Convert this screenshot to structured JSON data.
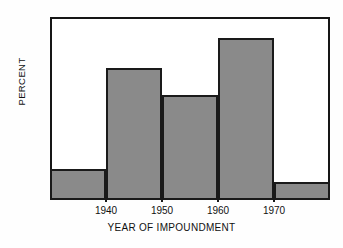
{
  "chart_data": {
    "type": "bar",
    "title": "",
    "subtitle": "",
    "xlabel": "YEAR OF IMPOUNDMENT",
    "ylabel": "PERCENT",
    "categories": [
      "1930-1940",
      "1940-1950",
      "1950-1960",
      "1960-1970",
      "1970-1980"
    ],
    "bin_edges": [
      1930,
      1940,
      1950,
      1960,
      1970,
      1980
    ],
    "values": [
      6.7,
      28.8,
      23.0,
      35.5,
      4.0
    ],
    "ylim": [
      0,
      40
    ],
    "xlim": [
      1930,
      1980
    ],
    "yticks": [
      0,
      10,
      20,
      30,
      40
    ],
    "ytick_labels": [
      "0",
      "10",
      "20",
      "30",
      "40"
    ],
    "xticks": [
      1940,
      1950,
      1960,
      1970
    ],
    "xtick_labels": [
      "1940",
      "1950",
      "1960",
      "1970"
    ],
    "grid": false,
    "legend": null,
    "bar_fill_color": "#8a8a8a",
    "bar_edge_color": "#1a1a1a",
    "axis_color": "#161616",
    "background_color": "#ffffff"
  }
}
